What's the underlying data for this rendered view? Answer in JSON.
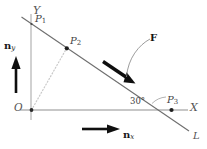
{
  "figure": {
    "background_color": "#ffffff",
    "axes": {
      "x_label": "X",
      "y_label": "Y",
      "origin_label": "O",
      "axis_color": "#8c8c8c",
      "y_axis_color": "#b5b5b5"
    },
    "line": {
      "label": "L",
      "color": "#6b6b6b",
      "angle_label": "30°",
      "angle_value": 30,
      "angle_unit": "degrees"
    },
    "points": [
      {
        "id": "P1",
        "label": "P",
        "subscript": "1",
        "x": 31,
        "y": 22
      },
      {
        "id": "P2",
        "label": "P",
        "subscript": "2",
        "x": 67,
        "y": 48
      },
      {
        "id": "P3",
        "label": "P",
        "subscript": "3",
        "x": 172,
        "y": 110
      }
    ],
    "construction_line": {
      "name": "dotted-O-to-P2",
      "style": "dotted",
      "color": "#c4c4c4",
      "from": "O",
      "to": "P2"
    },
    "vectors": [
      {
        "id": "F",
        "label": "F",
        "style": "bold",
        "color": "#111111",
        "description": "force arrow along line L pointing down-right"
      },
      {
        "id": "nx",
        "label": "n",
        "subscript": "x",
        "style": "bold",
        "color": "#111111",
        "description": "unit normal along X pointing right"
      },
      {
        "id": "ny",
        "label": "n",
        "subscript": "y",
        "style": "bold",
        "color": "#111111",
        "description": "unit normal along Y pointing up"
      }
    ]
  }
}
